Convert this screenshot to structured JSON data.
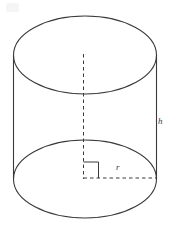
{
  "figure": {
    "name": "right-circular-cylinder",
    "canvas": {
      "width": 170,
      "height": 228,
      "background": "#ffffff"
    },
    "stroke": {
      "color": "#3a3a3a",
      "solid_width": 1.1,
      "dash_width": 1.0,
      "dash_pattern": "3.5 3"
    },
    "labels": {
      "height": "h",
      "radius": "r"
    },
    "geometry": {
      "center_x": 85,
      "radius_x": 71.5,
      "radius_y": 39,
      "top_ellipse_center_y": 55,
      "bottom_ellipse_center_y": 179,
      "left_edge_x": 13.5,
      "right_edge_x": 156.5,
      "axis_x": 83.5,
      "axis_top_y": 54,
      "axis_bottom_y": 179,
      "radius_line_y": 178,
      "right_angle_size": 15
    },
    "label_positions": {
      "height_label": {
        "x": 158,
        "y": 117
      },
      "radius_label": {
        "x": 116,
        "y": 163
      }
    }
  }
}
